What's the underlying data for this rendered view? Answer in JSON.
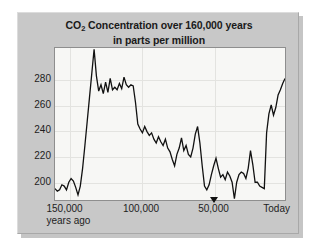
{
  "chart_data": {
    "type": "line",
    "title": "CO2 Concentration over 160,000 years",
    "title_line1_pre": "CO",
    "title_line1_sub": "2",
    "title_line1_post": " Concentration over 160,000 years",
    "title_line2": "in parts per million",
    "subtitle": "in parts per million",
    "xlabel": "years ago",
    "ylabel": "parts per million",
    "grid": true,
    "legend": "none",
    "xlim": [
      160000,
      0
    ],
    "ylim": [
      185,
      305
    ],
    "x_tick_values": [
      150000,
      100000,
      50000,
      0
    ],
    "x_tick_labels": [
      "150,000",
      "100,000",
      "50,000",
      "Today"
    ],
    "x_tick_sublabel": "years ago",
    "y_tick_values": [
      200,
      220,
      240,
      260,
      280
    ],
    "y_tick_labels": [
      "200",
      "220",
      "240",
      "260",
      "280"
    ],
    "series": [
      {
        "name": "CO2 concentration",
        "color": "#111111",
        "x": [
          160000,
          158400,
          156800,
          155200,
          153600,
          152000,
          150400,
          148800,
          147200,
          145600,
          144000,
          142400,
          140800,
          139200,
          137600,
          136000,
          134400,
          132800,
          131200,
          129600,
          128000,
          126400,
          124800,
          123200,
          121600,
          120000,
          118400,
          116800,
          115200,
          113600,
          112000,
          110400,
          108800,
          107200,
          105600,
          104000,
          102400,
          100800,
          99200,
          97600,
          96000,
          94400,
          92800,
          91200,
          89600,
          88000,
          86400,
          84800,
          83200,
          81600,
          80000,
          78400,
          76800,
          75200,
          73600,
          72000,
          70400,
          68800,
          67200,
          65600,
          64000,
          62400,
          60800,
          59200,
          57600,
          56000,
          54400,
          52800,
          51200,
          49600,
          48000,
          46400,
          44800,
          43200,
          41600,
          40000,
          38400,
          36800,
          35200,
          33600,
          32000,
          30400,
          28800,
          27200,
          25600,
          24000,
          22400,
          20800,
          19200,
          17600,
          16000,
          14400,
          12800,
          11200,
          9600,
          8000,
          6400,
          4800,
          3200,
          1600,
          0
        ],
        "y": [
          194,
          192,
          193,
          197,
          196,
          193,
          199,
          202,
          200,
          195,
          189,
          196,
          210,
          228,
          247,
          266,
          285,
          304,
          283,
          271,
          276,
          269,
          278,
          270,
          281,
          272,
          274,
          272,
          277,
          273,
          282,
          276,
          274,
          276,
          275,
          262,
          245,
          241,
          238,
          243,
          239,
          236,
          238,
          233,
          230,
          235,
          231,
          228,
          233,
          226,
          223,
          217,
          212,
          221,
          226,
          234,
          224,
          228,
          221,
          219,
          226,
          237,
          243,
          230,
          212,
          196,
          193,
          197,
          205,
          212,
          218,
          210,
          203,
          205,
          201,
          207,
          204,
          199,
          186,
          199,
          205,
          207,
          206,
          202,
          210,
          224,
          213,
          199,
          199,
          196,
          195,
          194,
          238,
          253,
          260,
          252,
          258,
          268,
          272,
          277,
          281
        ]
      }
    ]
  },
  "colors": {
    "panel_background": "#c8c8c8",
    "plot_background": "#f7f7f5",
    "line": "#111111",
    "axis": "#8e8e8e",
    "grid": "#e3e3e0",
    "text": "#1d1d1d"
  }
}
